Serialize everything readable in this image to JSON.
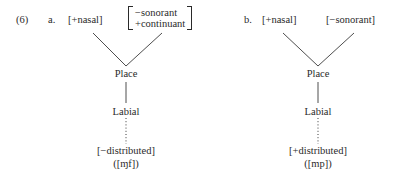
{
  "example": {
    "number": "(6)"
  },
  "panels": [
    {
      "label": "a.",
      "left_feature": "[+nasal]",
      "right_features": [
        "−sonorant",
        "+continuant"
      ],
      "place_node": "Place",
      "articulator_node": "Labial",
      "dependent_feature": "[−distributed]",
      "example_segments": "([ɱf])"
    },
    {
      "label": "b.",
      "left_feature": "[+nasal]",
      "right_feature": "[−sonorant]",
      "place_node": "Place",
      "articulator_node": "Labial",
      "dependent_feature": "[+distributed]",
      "example_segments": "([mp])"
    }
  ]
}
